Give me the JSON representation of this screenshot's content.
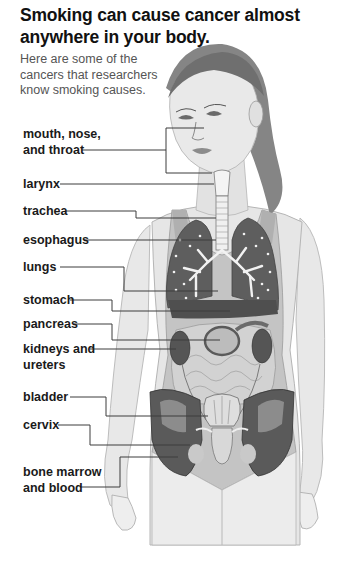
{
  "header": {
    "title": "Smoking can cause cancer almost anywhere in your body.",
    "subtitle": "Here are some of the cancers that researchers know smoking causes."
  },
  "labels": [
    {
      "id": "mouth-nose-throat",
      "line1": "mouth, nose,",
      "line2": "and throat",
      "top": 126
    },
    {
      "id": "larynx",
      "line1": "larynx",
      "line2": "",
      "top": 176
    },
    {
      "id": "trachea",
      "line1": "trachea",
      "line2": "",
      "top": 203
    },
    {
      "id": "esophagus",
      "line1": "esophagus",
      "line2": "",
      "top": 231
    },
    {
      "id": "lungs",
      "line1": "lungs",
      "line2": "",
      "top": 259
    },
    {
      "id": "stomach",
      "line1": "stomach",
      "line2": "",
      "top": 290
    },
    {
      "id": "pancreas",
      "line1": "pancreas",
      "line2": "",
      "top": 315
    },
    {
      "id": "kidneys-ureters",
      "line1": "kidneys and",
      "line2": "ureters",
      "top": 341
    },
    {
      "id": "bladder",
      "line1": "bladder",
      "line2": "",
      "top": 390
    },
    {
      "id": "cervix",
      "line1": "cervix",
      "line2": "",
      "top": 418
    },
    {
      "id": "bone-marrow-blood",
      "line1": "bone marrow",
      "line2": "and blood",
      "top": 461
    }
  ],
  "colors": {
    "skin": "#e6e6e6",
    "skin_shadow": "#cfcfcf",
    "hair": "#7a7a7a",
    "swimsuit": "#bdbdbd",
    "organ_dark": "#5a5a5a",
    "organ_mid": "#8a8a8a",
    "airway": "#f2f2f2",
    "leader": "#3c3c3c"
  }
}
